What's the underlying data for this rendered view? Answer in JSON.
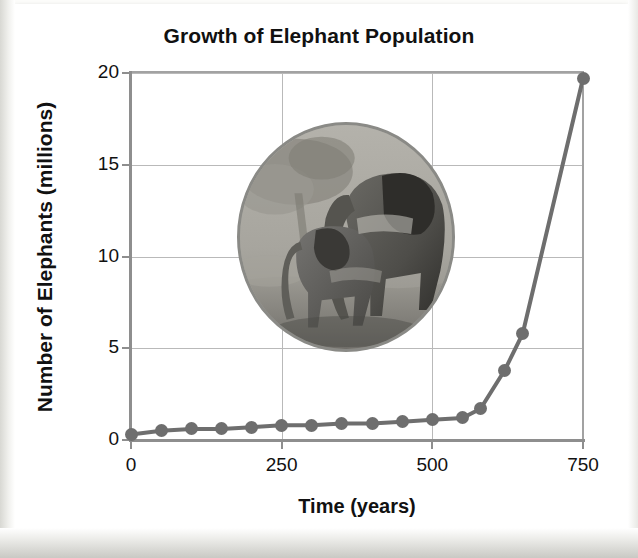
{
  "page": {
    "kind": "textbook-scan",
    "background_color": "#ffffff",
    "border_color": "#c9c9c4"
  },
  "chart_data": {
    "type": "line",
    "title": "Growth of Elephant Population",
    "xlabel": "Time (years)",
    "ylabel": "Number of Elephants (millions)",
    "xlim": [
      0,
      750
    ],
    "ylim": [
      0,
      20
    ],
    "xticks": [
      0,
      250,
      500,
      750
    ],
    "yticks": [
      0,
      5,
      10,
      15,
      20
    ],
    "grid": true,
    "legend": null,
    "series_color": "#6e6e6e",
    "marker": "circle",
    "x": [
      0,
      50,
      100,
      150,
      200,
      250,
      300,
      350,
      400,
      450,
      500,
      550,
      580,
      620,
      650,
      750
    ],
    "values": [
      0.3,
      0.5,
      0.6,
      0.6,
      0.7,
      0.8,
      0.8,
      0.9,
      0.9,
      1.0,
      1.1,
      1.2,
      1.7,
      3.8,
      5.8,
      19.7
    ],
    "annotations": []
  },
  "photo": {
    "subject": "elephant-adult-and-calf",
    "shape": "circle",
    "style": "grayscale-photograph",
    "border_color": "#8a8a86"
  }
}
